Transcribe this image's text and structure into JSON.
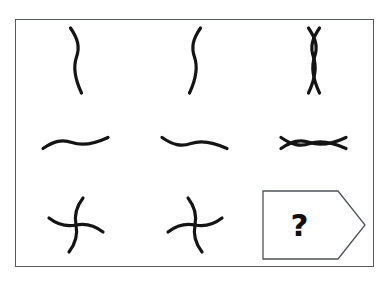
{
  "figure": {
    "kind": "visual-analogy-matrix",
    "title": "",
    "frame": {
      "border_color": "#555b5f",
      "background_color": "#ffffff",
      "x": 15,
      "y": 19,
      "width": 359,
      "height": 248
    },
    "stroke_color": "#141414",
    "rows": 3,
    "columns": 3,
    "cells": [
      {
        "row": 1,
        "column": 1,
        "name": "vertical-s-curve",
        "label": "Vertical S curve",
        "description": "A single vertical sine wave curving right then left",
        "stroke_width": 3.2
      },
      {
        "row": 1,
        "column": 2,
        "name": "vertical-s-curve-mirrored",
        "label": "Mirrored vertical S curve",
        "description": "The vertical sine wave flipped horizontally",
        "stroke_width": 3.2
      },
      {
        "row": 1,
        "column": 3,
        "name": "vertical-figure-eight",
        "label": "Vertical figure eight",
        "description": "Both vertical S curves superimposed, forming two stacked lens shapes",
        "stroke_width": 3.2
      },
      {
        "row": 2,
        "column": 1,
        "name": "horizontal-wave",
        "label": "Horizontal wave",
        "description": "A horizontal sine wave dipping down then rising up",
        "stroke_width": 3.2
      },
      {
        "row": 2,
        "column": 2,
        "name": "horizontal-wave-mirrored",
        "label": "Mirrored horizontal wave",
        "description": "The horizontal sine wave flipped vertically",
        "stroke_width": 3.2
      },
      {
        "row": 2,
        "column": 3,
        "name": "horizontal-figure-eight",
        "label": "Horizontal figure eight",
        "description": "Both horizontal waves superimposed, forming a lying infinity symbol",
        "stroke_width": 3.2
      },
      {
        "row": 3,
        "column": 1,
        "name": "pinwheel-counterclockwise",
        "label": "Counterclockwise pinwheel",
        "description": "Four curved arms radiating from a centre point, swirling counterclockwise",
        "stroke_width": 3.2
      },
      {
        "row": 3,
        "column": 2,
        "name": "pinwheel-clockwise",
        "label": "Clockwise pinwheel",
        "description": "Four curved arms radiating from a centre point, swirling clockwise",
        "stroke_width": 3.2
      },
      {
        "row": 3,
        "column": 3,
        "name": "answer-placeholder",
        "label": "?",
        "description": "Arrow shaped banner holding a question mark for the missing answer",
        "stroke_width": 1.3
      }
    ],
    "answer_box": {
      "question_mark": "?",
      "outline_color": "#4d5357",
      "fill_color": "#ffffff",
      "shape": "right-pointing-pentagon-banner"
    }
  }
}
